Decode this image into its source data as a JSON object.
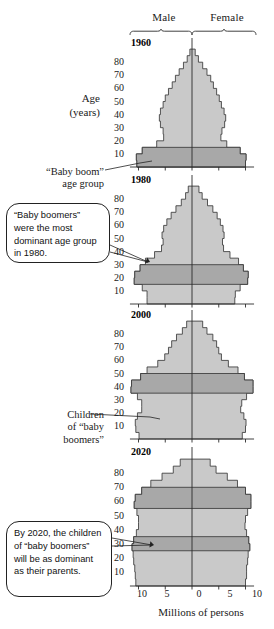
{
  "header": {
    "male_label": "Male",
    "female_label": "Female"
  },
  "axes": {
    "y_axis_title_line1": "Age",
    "y_axis_title_line2": "(years)",
    "y_ticks": [
      "80",
      "70",
      "60",
      "50",
      "40",
      "30",
      "20",
      "10"
    ],
    "x_ticks": [
      "10",
      "5",
      "0",
      "5",
      "10"
    ],
    "x_axis_caption": "Millions of persons"
  },
  "annotations": {
    "baby_boom_line1": "“Baby boom”",
    "baby_boom_line2": "age group",
    "children_line1": "Children",
    "children_line2": "of “baby",
    "children_line3": "boomers”",
    "callout_1980": "“Baby boomers” were the most dominant age group in 1980.",
    "callout_2020": "By 2020, the children of “baby boomers” will be as dominant as their parents."
  },
  "colors": {
    "fill_light": "#c9c9c9",
    "fill_dark": "#a8a8a8",
    "outline": "#3a3a3a",
    "axis": "#2b2b2b",
    "text": "#1a1a1a",
    "background": "#ffffff"
  },
  "panels": [
    {
      "year": "1960"
    },
    {
      "year": "1980"
    },
    {
      "year": "2000"
    },
    {
      "year": "2020"
    }
  ],
  "chart_data": {
    "type": "bar",
    "subtype": "population-pyramid",
    "xlabel": "Millions of persons",
    "ylabel": "Age (years)",
    "xlim": [
      -12,
      12
    ],
    "ylim": [
      0,
      90
    ],
    "x_tick_values": [
      -10,
      -5,
      0,
      5,
      10
    ],
    "x_tick_labels": [
      "10",
      "5",
      "0",
      "5",
      "10"
    ],
    "y_tick_values": [
      10,
      20,
      30,
      40,
      50,
      60,
      70,
      80
    ],
    "y_tick_labels": [
      "80",
      "70",
      "60",
      "50",
      "40",
      "30",
      "20",
      "10"
    ],
    "grid": false,
    "legend": [
      "Male",
      "Female"
    ],
    "legend_position": "top",
    "units": "millions of persons per 5-year age band",
    "age_bands": [
      "0-4",
      "5-9",
      "10-14",
      "15-19",
      "20-24",
      "25-29",
      "30-34",
      "35-39",
      "40-44",
      "45-49",
      "50-54",
      "55-59",
      "60-64",
      "65-69",
      "70-74",
      "75-79",
      "80-84",
      "85+"
    ],
    "panels": [
      {
        "year": "1960",
        "highlight_bands": [
          "0-4",
          "5-9",
          "10-14"
        ],
        "highlight_label": "“Baby boom” age group",
        "male": [
          10.3,
          10.4,
          9.3,
          6.6,
          5.3,
          5.4,
          5.9,
          6.1,
          5.9,
          5.4,
          5.0,
          4.4,
          3.7,
          3.1,
          2.4,
          1.6,
          0.9,
          0.4
        ],
        "female": [
          10.0,
          10.1,
          9.0,
          6.5,
          5.4,
          5.6,
          6.1,
          6.3,
          6.0,
          5.5,
          5.1,
          4.6,
          4.0,
          3.5,
          2.8,
          2.0,
          1.2,
          0.6
        ]
      },
      {
        "year": "1980",
        "highlight_bands": [
          "15-19",
          "20-24",
          "25-29"
        ],
        "highlight_label": "“Baby boomers” were the most dominant age group in 1980.",
        "male": [
          8.4,
          8.4,
          9.3,
          10.8,
          10.7,
          9.7,
          8.7,
          7.0,
          5.7,
          5.4,
          5.6,
          5.3,
          4.7,
          3.9,
          3.0,
          2.0,
          1.2,
          0.7
        ],
        "female": [
          8.0,
          8.1,
          9.0,
          10.4,
          10.5,
          9.6,
          8.7,
          7.1,
          5.9,
          5.7,
          6.0,
          5.8,
          5.3,
          4.7,
          3.9,
          2.9,
          1.9,
          1.3
        ]
      },
      {
        "year": "2000",
        "highlight_bands": [
          "35-39",
          "40-44",
          "45-49"
        ],
        "highlight_label": "Children of “baby boomers”",
        "male": [
          9.9,
          10.5,
          10.6,
          10.2,
          9.4,
          9.4,
          10.2,
          11.4,
          11.3,
          9.6,
          8.4,
          6.4,
          5.1,
          4.4,
          3.8,
          2.9,
          1.8,
          1.0
        ],
        "female": [
          9.4,
          10.0,
          10.1,
          9.7,
          9.1,
          9.3,
          10.2,
          11.4,
          11.4,
          9.8,
          8.6,
          6.8,
          5.5,
          5.0,
          4.6,
          3.9,
          2.8,
          2.0
        ]
      },
      {
        "year": "2020",
        "highlight_bands": [
          "25-29",
          "30-34",
          "55-59",
          "60-64",
          "65-69"
        ],
        "highlight_label": "By 2020, the children of “baby boomers” will be as dominant as their parents.",
        "male": [
          10.5,
          10.6,
          10.7,
          10.9,
          11.0,
          11.2,
          10.9,
          10.4,
          10.0,
          10.0,
          10.3,
          10.8,
          10.6,
          9.4,
          7.7,
          5.6,
          3.5,
          2.2
        ],
        "female": [
          10.0,
          10.2,
          10.2,
          10.4,
          10.5,
          10.8,
          10.6,
          10.2,
          9.9,
          10.0,
          10.4,
          11.0,
          11.0,
          10.0,
          8.5,
          6.6,
          4.5,
          3.4
        ]
      }
    ]
  }
}
